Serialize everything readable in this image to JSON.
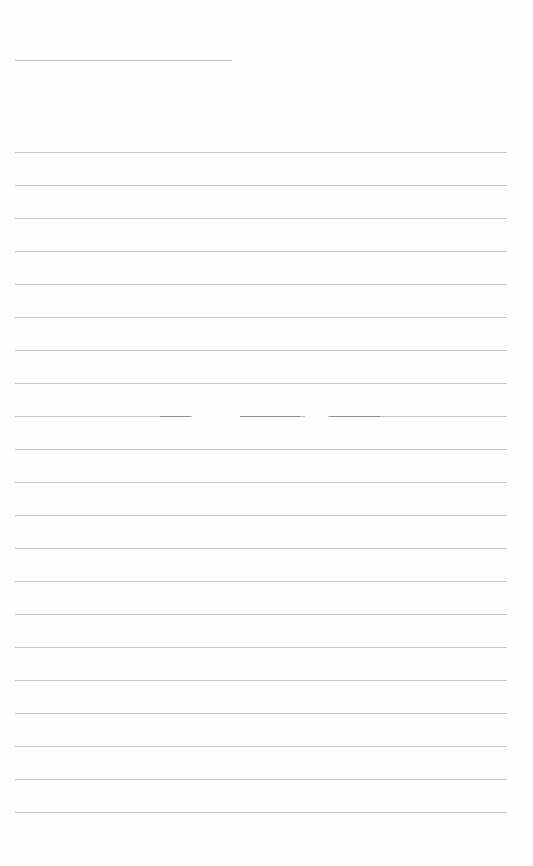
{
  "page": {
    "type": "blank lined notebook page",
    "background_color": "#fefefe",
    "rule_color": "#c4c4c4",
    "header_rule": {
      "x1": 15,
      "x2": 232,
      "y": 60
    },
    "rules": {
      "count": 21,
      "x1": 15,
      "x2": 507,
      "first_y": 152,
      "spacing": 33
    },
    "broken_rule": {
      "index": 8,
      "gaps": [
        [
          192,
          240
        ],
        [
          305,
          328
        ]
      ]
    },
    "text": []
  }
}
